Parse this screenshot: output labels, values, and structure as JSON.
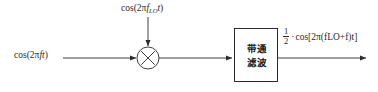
{
  "diagram": {
    "background_color": "#ffffff",
    "line_color": "#2b2b2b",
    "nodes": {
      "mixer": {
        "name": "multiplier",
        "symbol": "cross-in-circle",
        "cx": 148,
        "cy": 58,
        "r": 11
      },
      "filter": {
        "name": "bandpass-filter",
        "line1": "带通",
        "line2": "滤波",
        "x": 234,
        "y": 28,
        "width": 44,
        "height": 54
      }
    },
    "labels": {
      "input_signal": {
        "prefix": "cos(2π",
        "var_f": "f",
        "var_t": "t",
        "suffix": ")"
      },
      "local_oscillator": {
        "prefix": "cos(2π",
        "var_f": "f",
        "subscript": "LO",
        "var_t": "t",
        "suffix": ")"
      },
      "output": {
        "numerator": "1",
        "denominator": "2",
        "dot": "·",
        "expr_open": "cos[2π(",
        "var_f_lo": "f",
        "subscript": "LO",
        "plus": "+",
        "var_f": "f",
        "close_paren": ")",
        "var_t": "t",
        "expr_close": "]"
      }
    },
    "edges": [
      {
        "name": "input-to-mixer",
        "from": "input-label",
        "to": "mixer",
        "direction": "right"
      },
      {
        "name": "lo-to-mixer",
        "from": "lo-label",
        "to": "mixer",
        "direction": "down"
      },
      {
        "name": "mixer-to-filter",
        "from": "mixer",
        "to": "filter",
        "direction": "right"
      },
      {
        "name": "filter-to-output",
        "from": "filter",
        "to": "output",
        "direction": "right"
      }
    ]
  }
}
